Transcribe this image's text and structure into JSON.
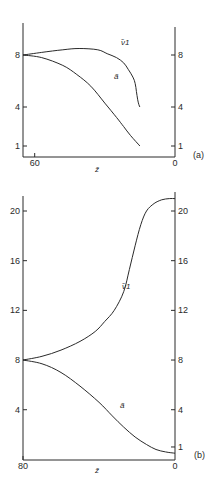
{
  "chart_data": [
    {
      "type": "line",
      "panel_label": "(a)",
      "xlabel": "z̃",
      "x_ticks": [
        {
          "value": 60,
          "label": "60"
        },
        {
          "value": 0,
          "label": "0"
        }
      ],
      "xlim": [
        65,
        0
      ],
      "ylim": [
        0,
        10.5
      ],
      "y_ticks_left": [
        {
          "value": 8,
          "label": "8"
        },
        {
          "value": 4,
          "label": "4"
        },
        {
          "value": 1,
          "label": "1"
        }
      ],
      "y_ticks_right": [
        {
          "value": 8,
          "label": "8"
        },
        {
          "value": 4,
          "label": "4"
        },
        {
          "value": 1,
          "label": "1"
        }
      ],
      "grid": false,
      "series": [
        {
          "name": "ν̃₁",
          "label": "ν̃1",
          "x": [
            65,
            57,
            48,
            41,
            33,
            29,
            25,
            22,
            20,
            18,
            17,
            16.5,
            16,
            15.5,
            15
          ],
          "y": [
            8,
            8.2,
            8.4,
            8.5,
            8.4,
            8.1,
            7.8,
            7.4,
            6.9,
            6.3,
            5.8,
            5.2,
            4.6,
            4.2,
            4.0
          ]
        },
        {
          "name": "ã",
          "label": "ã",
          "x": [
            65,
            57,
            48,
            42,
            36,
            30,
            25,
            22,
            19,
            15
          ],
          "y": [
            8,
            7.8,
            7.2,
            6.5,
            5.6,
            4.3,
            3.2,
            2.5,
            1.8,
            1.0
          ]
        }
      ],
      "annotations": [
        {
          "text": "ν̃1",
          "series": "ν̃₁"
        },
        {
          "text": "ã",
          "series": "ã"
        }
      ]
    },
    {
      "type": "line",
      "panel_label": "(b)",
      "xlabel": "z̃",
      "x_ticks": [
        {
          "value": 80,
          "label": "80"
        },
        {
          "value": 0,
          "label": "0"
        }
      ],
      "xlim": [
        80,
        0
      ],
      "ylim": [
        0,
        21.2
      ],
      "y_ticks_left": [
        {
          "value": 20,
          "label": "20"
        },
        {
          "value": 16,
          "label": "16"
        },
        {
          "value": 12,
          "label": "12"
        },
        {
          "value": 8,
          "label": "8"
        },
        {
          "value": 4,
          "label": "4"
        }
      ],
      "y_ticks_right": [
        {
          "value": 20,
          "label": "20"
        },
        {
          "value": 16,
          "label": "16"
        },
        {
          "value": 12,
          "label": "12"
        },
        {
          "value": 8,
          "label": "8"
        },
        {
          "value": 4,
          "label": "4"
        },
        {
          "value": 1,
          "label": "1"
        }
      ],
      "grid": false,
      "series": [
        {
          "name": "ν̃₁",
          "label": "ν̃1",
          "x": [
            80,
            70,
            60,
            50,
            42,
            37,
            32,
            27,
            24,
            21,
            18,
            15,
            11,
            7,
            3,
            0
          ],
          "y": [
            8,
            8.3,
            8.8,
            9.5,
            10.3,
            11.1,
            12.0,
            13.5,
            15.3,
            17.2,
            18.9,
            20.0,
            20.6,
            20.9,
            21.0,
            21.0
          ]
        },
        {
          "name": "ã",
          "label": "ã",
          "x": [
            80,
            70,
            60,
            50,
            40,
            33,
            27,
            21,
            15,
            10,
            5,
            0
          ],
          "y": [
            8,
            7.7,
            7.0,
            5.9,
            4.6,
            3.5,
            2.6,
            1.8,
            1.2,
            0.8,
            0.6,
            0.5
          ]
        }
      ],
      "annotations": [
        {
          "text": "ν̃1",
          "series": "ν̃₁"
        },
        {
          "text": "ã",
          "series": "ã"
        }
      ]
    }
  ]
}
